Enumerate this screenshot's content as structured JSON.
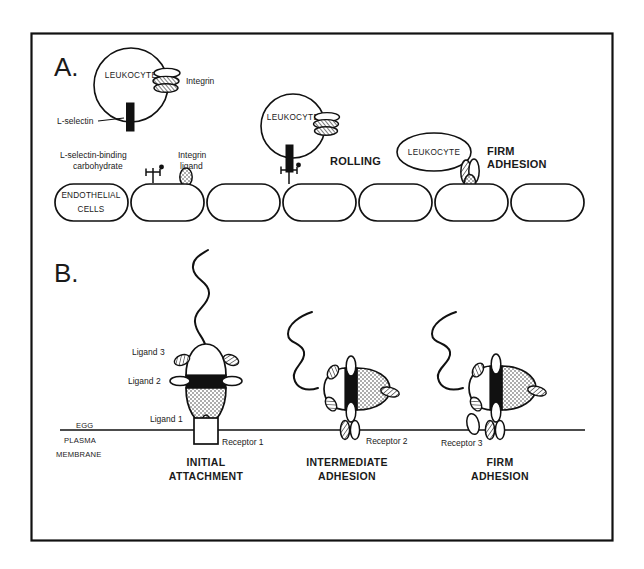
{
  "figure": {
    "type": "scientific-diagram",
    "panels": 2,
    "frame": {
      "x": 31,
      "y": 33,
      "width": 582,
      "height": 508,
      "stroke": "#111111"
    },
    "background": "#ffffff",
    "ink": "#111111"
  },
  "panel_a": {
    "letter": "A.",
    "topic": "leukocyte-adhesion-cascade",
    "leukocytes": [
      {
        "id": "leukocyte-1",
        "label": "LEUKOCYTE",
        "stage": "tethering",
        "cx": 131,
        "cy": 85,
        "rx": 37,
        "ry": 37
      },
      {
        "id": "leukocyte-2",
        "label": "LEUKOCYTE",
        "stage": "rolling",
        "cx": 293,
        "cy": 126,
        "rx": 32,
        "ry": 32
      },
      {
        "id": "leukocyte-3",
        "label": "LEUKOCYTE",
        "stage": "firm-adhesion",
        "cx": 434,
        "cy": 152,
        "rx": 37,
        "ry": 19
      }
    ],
    "leukocyte_molecules": [
      {
        "name": "L-selectin",
        "label": "L-selectin",
        "shape": "black-bar"
      },
      {
        "name": "integrin",
        "label": "Integrin",
        "shape": "hatched-oval-stack"
      }
    ],
    "endothelial_molecules": [
      {
        "name": "l-selectin-binding-carbohydrate",
        "label": "L-selectin-binding carbohydrate",
        "shape": "branched-cross"
      },
      {
        "name": "integrin-ligand",
        "label": "Integrin ligand",
        "shape": "open-oval"
      }
    ],
    "endothelium": {
      "label": "ENDOTHELIAL CELLS",
      "cell_count": 7,
      "cell_width": 73,
      "cell_height": 37,
      "row_y": 184
    },
    "stage_labels": [
      {
        "name": "rolling",
        "text": "ROLLING",
        "x": 330,
        "y": 162
      },
      {
        "name": "firm-adhesion",
        "text_line1": "FIRM",
        "text_line2": "ADHESION",
        "x": 478,
        "y": 157
      }
    ]
  },
  "panel_b": {
    "letter": "B.",
    "topic": "sperm-egg-adhesion-stages",
    "membrane": {
      "label_line1": "EGG",
      "label_line2": "PLASMA",
      "label_line3": "MEMBRANE",
      "y": 430
    },
    "ligand_labels": [
      {
        "name": "ligand-3",
        "text": "Ligand 3",
        "x": 132,
        "y": 352
      },
      {
        "name": "ligand-2",
        "text": "Ligand  2",
        "x": 130,
        "y": 380
      },
      {
        "name": "ligand-1",
        "text": "Ligand 1",
        "x": 152,
        "y": 420
      }
    ],
    "stages": [
      {
        "id": "initial-attachment",
        "caption_line1": "INITIAL",
        "caption_line2": "ATTACHMENT",
        "receptor_label": "Receptor 1",
        "receptor_shape": "open-rectangle",
        "orientation": "vertical",
        "cx": 206,
        "caption_x": 206,
        "caption_y": 466
      },
      {
        "id": "intermediate-adhesion",
        "caption_line1": "INTERMEDIATE",
        "caption_line2": "ADHESION",
        "receptor_label": "Receptor 2",
        "receptor_shape": "paired-ovals",
        "orientation": "horizontal",
        "cx": 347,
        "caption_x": 347,
        "caption_y": 466
      },
      {
        "id": "firm-adhesion",
        "caption_line1": "FIRM",
        "caption_line2": "ADHESION",
        "receptor_label": "Receptor 3",
        "receptor_shape": "paired-ovals-docked",
        "orientation": "horizontal",
        "cx": 492,
        "caption_x": 500,
        "caption_y": 466
      }
    ],
    "sperm_parts": [
      {
        "name": "flagellum",
        "style": "wavy-line"
      },
      {
        "name": "acrosomal-cap",
        "fill": "#ffffff"
      },
      {
        "name": "equatorial-band",
        "fill": "#111111"
      },
      {
        "name": "post-acrosomal-body",
        "fill": "stipple"
      }
    ]
  }
}
